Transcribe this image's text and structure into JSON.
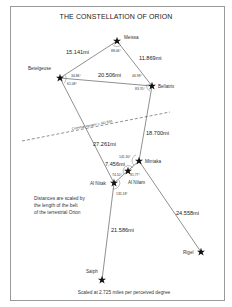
{
  "title": "THE CONSTELLATION OF ORION",
  "stars": [
    {
      "id": "meissa",
      "name": "Meissa",
      "x": 117,
      "y": 41
    },
    {
      "id": "betelgeuse",
      "name": "Betelgeuse",
      "x": 60,
      "y": 78
    },
    {
      "id": "bellatrix",
      "name": "Bellatrix",
      "x": 152,
      "y": 86
    },
    {
      "id": "mintaka",
      "name": "Mintaka",
      "x": 139,
      "y": 161
    },
    {
      "id": "al-nilam",
      "name": "Al Nilam",
      "x": 128,
      "y": 171
    },
    {
      "id": "al-nitak",
      "name": "Al Nitak",
      "x": 114,
      "y": 183
    },
    {
      "id": "saiph",
      "name": "Saiph",
      "x": 102,
      "y": 280
    },
    {
      "id": "rigel",
      "name": "Rigel",
      "x": 201,
      "y": 252
    }
  ],
  "distances": {
    "meissa_betelgeuse": "15.141mi",
    "meissa_bellatrix": "11.869mi",
    "betelgeuse_bellatrix": "20.506mi",
    "bellatrix_mintaka": "18.700mi",
    "betelgeuse_alnitak": "27.261mi",
    "belt": "7.456mi",
    "mintaka_rigel": "24.558mi",
    "alnitak_saiph": "21.586mi"
  },
  "angles": {
    "meissa": "88.06°",
    "betelgeuse_top": "34.86°",
    "betelgeuse_bottom": "61.08°",
    "bellatrix_top": "46.98°",
    "bellatrix_bottom": "83.70°",
    "mintaka": "141.30°",
    "al_nilam_left": "74.10°",
    "al_nilam_right": "31.77°",
    "al_nitak": "135.18°"
  },
  "equator_label": "Celestial equator c. AD 300",
  "note_lines": [
    "Distances are scaled by",
    "the length of the belt",
    "of the terrestrial Orion"
  ],
  "scale_caption": "Scaled at 2.725 miles per perceived degree"
}
